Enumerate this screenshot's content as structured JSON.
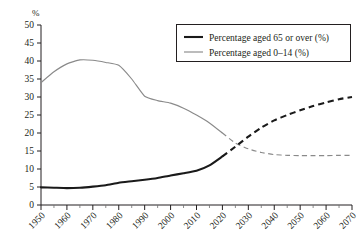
{
  "chart_data": {
    "type": "line",
    "title": "",
    "subtitle": "",
    "xlabel": "",
    "ylabel": "",
    "y_unit_label": "%",
    "xlim": [
      1950,
      2070
    ],
    "ylim": [
      0,
      50
    ],
    "grid": false,
    "legend_position": "top-right",
    "x_major_ticks": [
      1950,
      1960,
      1970,
      1980,
      1990,
      2000,
      2010,
      2020,
      2030,
      2040,
      2050,
      2060,
      2070
    ],
    "x_minor_tick_step": 5,
    "y_ticks": [
      0,
      5,
      10,
      15,
      20,
      25,
      30,
      35,
      40,
      45,
      50
    ],
    "x_tick_labels": [
      "1950",
      "1960",
      "1970",
      "1980",
      "1990",
      "2000",
      "2010",
      "2020",
      "2030",
      "2040",
      "2050",
      "2060",
      "2070"
    ],
    "y_tick_labels": [
      "0",
      "5",
      "10",
      "15",
      "20",
      "25",
      "30",
      "35",
      "40",
      "45",
      "50"
    ],
    "projection_start_year": 2020,
    "annotations": [
      {
        "text": "lines become dashed from 2020 onward (projection)"
      }
    ],
    "series": [
      {
        "name": "Percentage aged 65 or over (%)",
        "color": "#1a1a1a",
        "style": "thick-solid-then-dashed",
        "x": [
          1950,
          1955,
          1960,
          1965,
          1970,
          1975,
          1980,
          1985,
          1990,
          1995,
          2000,
          2005,
          2010,
          2015,
          2020,
          2025,
          2030,
          2035,
          2040,
          2045,
          2050,
          2055,
          2060,
          2065,
          2070
        ],
        "values": [
          4.9,
          4.8,
          4.7,
          4.8,
          5.1,
          5.5,
          6.2,
          6.6,
          7.0,
          7.5,
          8.2,
          8.8,
          9.5,
          11.0,
          13.5,
          16.2,
          19.0,
          21.5,
          23.5,
          25.0,
          26.3,
          27.5,
          28.5,
          29.4,
          30.0
        ]
      },
      {
        "name": "Percentage aged 0–14 (%)",
        "color": "#8a8a8a",
        "style": "thin-solid-then-dashed",
        "x": [
          1950,
          1955,
          1960,
          1965,
          1970,
          1975,
          1980,
          1985,
          1990,
          1995,
          2000,
          2005,
          2010,
          2015,
          2020,
          2025,
          2030,
          2035,
          2040,
          2045,
          2050,
          2055,
          2060,
          2065,
          2070
        ],
        "values": [
          34.0,
          37.0,
          39.2,
          40.3,
          40.2,
          39.6,
          38.8,
          35.0,
          30.2,
          29.0,
          28.3,
          26.9,
          25.0,
          22.8,
          20.0,
          17.2,
          15.6,
          14.6,
          14.0,
          13.8,
          13.7,
          13.7,
          13.7,
          13.8,
          13.8
        ]
      }
    ]
  },
  "legend": {
    "entries": [
      {
        "label": "Percentage aged 65 or over (%)",
        "swatch": "thick-black-line"
      },
      {
        "label": "Percentage aged 0–14 (%)",
        "swatch": "thin-gray-line"
      }
    ]
  },
  "colors": {
    "series_old": "#1a1a1a",
    "series_young": "#8a8a8a",
    "axis": "#231f20",
    "background": "#ffffff"
  }
}
